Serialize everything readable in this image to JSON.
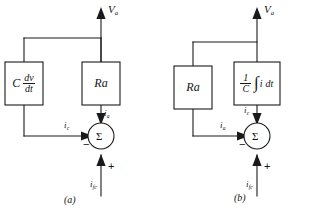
{
  "figure": {
    "type": "block-diagram",
    "stroke_color": "#1a1a1a",
    "background_color": "#ffffff",
    "panels": [
      {
        "id": "a",
        "caption": "(a)",
        "output_label": "V",
        "output_sub": "a",
        "left_block": {
          "kind": "derivative",
          "coefficient": "C",
          "numerator": "dv",
          "denominator": "dt"
        },
        "right_block": {
          "kind": "resistance",
          "label": "R",
          "sub": "a"
        },
        "summing_symbol": "Σ",
        "horizontal_input": {
          "label": "i",
          "sub": "c",
          "sign": "−"
        },
        "vertical_input": {
          "label": "i",
          "sub": "a"
        },
        "bottom_input": {
          "label": "i",
          "sub": "fc",
          "sign": "+"
        }
      },
      {
        "id": "b",
        "caption": "(b)",
        "output_label": "V",
        "output_sub": "a",
        "left_block": {
          "kind": "resistance",
          "label": "R",
          "sub": "a"
        },
        "right_block": {
          "kind": "integral",
          "numerator": "1",
          "denominator": "C",
          "integral_sign": "∫",
          "integrand": "i dt"
        },
        "summing_symbol": "Σ",
        "horizontal_input": {
          "label": "i",
          "sub": "a",
          "sign": "−"
        },
        "vertical_input": {
          "label": "i",
          "sub": "c"
        },
        "bottom_input": {
          "label": "i",
          "sub": "fc",
          "sign": "+"
        }
      }
    ]
  }
}
